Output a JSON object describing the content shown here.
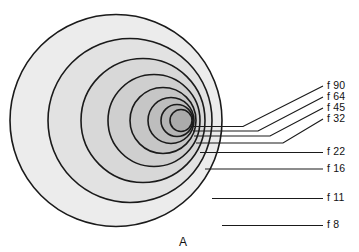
{
  "figure": {
    "panel_letter": "A",
    "background_color": "#ffffff",
    "outline_color": "#1a1a1a",
    "leader_color": "#1a1a1a",
    "text_color": "#111111"
  },
  "chart_data": {
    "type": "diagram",
    "title": "",
    "subtitle": "",
    "xlabel": "",
    "ylabel": "",
    "grid": false,
    "legend_position": "right",
    "annotations": [
      "A"
    ],
    "series": [
      {
        "name": "contours",
        "values": [
          90,
          64,
          45,
          32,
          22,
          16,
          11,
          8
        ]
      }
    ],
    "categories": [
      "f 90",
      "f 64",
      "f 45",
      "f 32",
      "f 22",
      "f 16",
      "f 11",
      "f 8"
    ],
    "rings": [
      {
        "label": "f 8",
        "value": 8,
        "cx": 116,
        "cy": 120.5,
        "r": 106,
        "fill": "#ececec",
        "leader_start_x": 222,
        "leader_start_y": 225.5,
        "leader_bend_x": 222,
        "leader_bend_y": 225.5,
        "leader_end_x": 323,
        "leader_end_y": 225.5,
        "label_x": 327,
        "label_y": 225.5
      },
      {
        "label": "f 11",
        "value": 11,
        "cx": 130,
        "cy": 120.5,
        "r": 82,
        "fill": "#e2e2e2",
        "leader_start_x": 212,
        "leader_start_y": 198.5,
        "leader_bend_x": 212,
        "leader_bend_y": 198.5,
        "leader_end_x": 323,
        "leader_end_y": 198.5,
        "label_x": 327,
        "label_y": 198.5
      },
      {
        "label": "f 16",
        "value": 16,
        "cx": 143,
        "cy": 120.5,
        "r": 62,
        "fill": "#d8d8d8",
        "leader_start_x": 205,
        "leader_start_y": 169.0,
        "leader_bend_x": 205,
        "leader_bend_y": 169.0,
        "leader_end_x": 323,
        "leader_end_y": 169.0,
        "label_x": 327,
        "label_y": 169.0
      },
      {
        "label": "f 22",
        "value": 22,
        "cx": 154,
        "cy": 120.5,
        "r": 46,
        "fill": "#cfcfcf",
        "leader_start_x": 200,
        "leader_start_y": 152.5,
        "leader_bend_x": 200,
        "leader_bend_y": 152.5,
        "leader_end_x": 323,
        "leader_end_y": 152.5,
        "label_x": 327,
        "label_y": 152.5
      },
      {
        "label": "f 32",
        "value": 32,
        "cx": 163,
        "cy": 120.5,
        "r": 33,
        "fill": "#c6c6c6",
        "leader_start_x": 196,
        "leader_start_y": 143.0,
        "leader_bend_x": 283,
        "leader_bend_y": 143.0,
        "leader_end_x": 323,
        "leader_end_y": 119.0,
        "label_x": 327,
        "label_y": 119.0
      },
      {
        "label": "f 45",
        "value": 45,
        "cx": 171,
        "cy": 120.5,
        "r": 23,
        "fill": "#bdbdbd",
        "leader_start_x": 194,
        "leader_start_y": 136.0,
        "leader_bend_x": 270,
        "leader_bend_y": 136.0,
        "leader_end_x": 323,
        "leader_end_y": 108.0,
        "label_x": 327,
        "label_y": 108.0
      },
      {
        "label": "f 64",
        "value": 64,
        "cx": 177,
        "cy": 120.5,
        "r": 16,
        "fill": "#b4b4b4",
        "leader_start_x": 193,
        "leader_start_y": 131.0,
        "leader_bend_x": 258,
        "leader_bend_y": 131.0,
        "leader_end_x": 323,
        "leader_end_y": 97.0,
        "label_x": 327,
        "label_y": 97.0
      },
      {
        "label": "f 90",
        "value": 90,
        "cx": 181,
        "cy": 120.5,
        "r": 11,
        "fill": "#ababab",
        "leader_start_x": 192,
        "leader_start_y": 126.5,
        "leader_bend_x": 243,
        "leader_bend_y": 126.5,
        "leader_end_x": 323,
        "leader_end_y": 86.0,
        "label_x": 327,
        "label_y": 86.0
      }
    ]
  }
}
